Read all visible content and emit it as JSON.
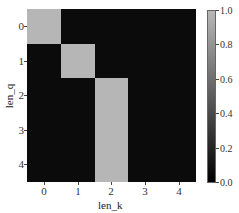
{
  "chart_data": {
    "type": "heatmap",
    "title": "",
    "xlabel": "len_k",
    "ylabel": "len_q",
    "x_ticks": [
      "0",
      "1",
      "2",
      "3",
      "4"
    ],
    "y_ticks": [
      "0",
      "1",
      "2",
      "3",
      "4"
    ],
    "values": [
      [
        1,
        0,
        0,
        0,
        0
      ],
      [
        0,
        1,
        0,
        0,
        0
      ],
      [
        0,
        0,
        1,
        0,
        0
      ],
      [
        0,
        0,
        1,
        0,
        0
      ],
      [
        0,
        0,
        1,
        0,
        0
      ]
    ],
    "colorbar": {
      "min": 0.0,
      "max": 1.0,
      "ticks": [
        "1.0",
        "0.8",
        "0.6",
        "0.4",
        "0.2",
        "0.0"
      ],
      "colormap": "gray"
    },
    "colors": {
      "low": "#0b0b0b",
      "high": "#b6b6b6"
    },
    "grid": false
  }
}
